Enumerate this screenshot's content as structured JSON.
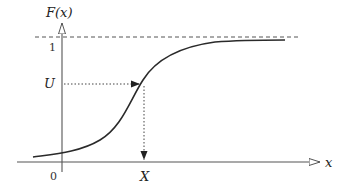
{
  "diagram": {
    "y_axis_label": "F(x)",
    "x_axis_label": "x",
    "tick_one": "1",
    "tick_zero": "0",
    "u_label": "U",
    "x_sample_label": "X",
    "colors": {
      "curve": "#2a2a2a",
      "axis": "#555555",
      "guide": "#444444"
    }
  }
}
